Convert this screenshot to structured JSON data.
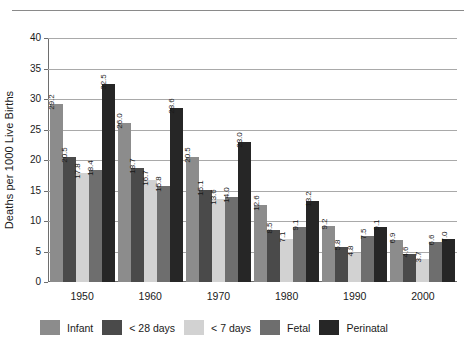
{
  "chart_data": {
    "type": "bar",
    "title": "",
    "subtitle": "",
    "xlabel": "",
    "ylabel": "Deaths per 1000 Live Births",
    "categories": [
      "1950",
      "1960",
      "1970",
      "1980",
      "1990",
      "2000"
    ],
    "ylim": [
      0,
      40
    ],
    "yticks": [
      0,
      5,
      10,
      15,
      20,
      25,
      30,
      35,
      40
    ],
    "ytick_labels": [
      "0",
      "5",
      "10",
      "15",
      "20",
      "25",
      "30",
      "35",
      "40"
    ],
    "grid": "horizontal",
    "legend_position": "bottom",
    "value_label_orientation": "vertical",
    "series": [
      {
        "name": "Infant",
        "color": "#8c8c8c",
        "values": [
          29.2,
          26.0,
          20.5,
          12.6,
          9.2,
          6.9
        ],
        "labels": [
          "29.2",
          "26.0",
          "20.5",
          "12.6",
          "9.2",
          "6.9"
        ]
      },
      {
        "name": "< 28 days",
        "color": "#4a4a4a",
        "values": [
          20.5,
          18.7,
          15.1,
          8.5,
          5.8,
          4.6
        ],
        "labels": [
          "20.5",
          "18.7",
          "15.1",
          "8.5",
          "5.8",
          "4.6"
        ]
      },
      {
        "name": "< 7 days",
        "color": "#d2d2d2",
        "values": [
          17.8,
          16.7,
          13.6,
          7.1,
          4.8,
          3.7
        ],
        "labels": [
          "17.8",
          "16.7",
          "13.6",
          "7.1",
          "4.8",
          "3.7"
        ]
      },
      {
        "name": "Fetal",
        "color": "#6e6e6e",
        "values": [
          18.4,
          15.8,
          14.0,
          9.1,
          7.5,
          6.6
        ],
        "labels": [
          "18.4",
          "15.8",
          "14.0",
          "9.1",
          "7.5",
          "6.6"
        ]
      },
      {
        "name": "Perinatal",
        "color": "#262626",
        "values": [
          32.5,
          28.6,
          23.0,
          13.2,
          9.1,
          7.0
        ],
        "labels": [
          "32.5",
          "28.6",
          "23.0",
          "13.2",
          "9.1",
          "7.0"
        ]
      }
    ]
  },
  "colors": {
    "axis": "#6e6e6e",
    "gridline": "#a9a9a9",
    "text": "#1a1a1a",
    "background": "#ffffff",
    "top_rule": "#8a8a8a"
  }
}
